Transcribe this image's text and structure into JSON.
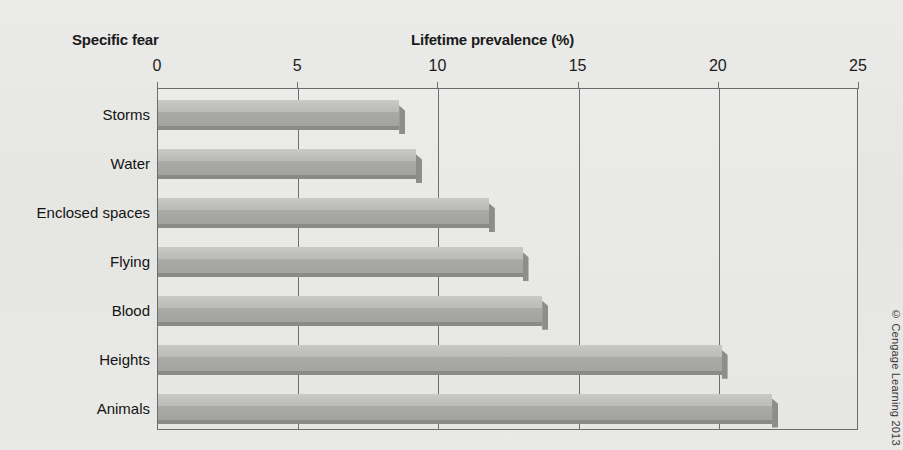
{
  "chart_data": {
    "type": "bar",
    "orientation": "horizontal",
    "title": "",
    "xlabel": "Lifetime prevalence (%)",
    "ylabel": "Specific fear",
    "categories": [
      "Storms",
      "Water",
      "Enclosed spaces",
      "Flying",
      "Blood",
      "Heights",
      "Animals"
    ],
    "values": [
      8.6,
      9.2,
      11.8,
      13.0,
      13.7,
      20.1,
      21.9
    ],
    "xlim": [
      0,
      25
    ],
    "xticks": [
      0,
      5,
      10,
      15,
      20,
      25
    ],
    "xtick_labels": [
      "0",
      "5",
      "10",
      "15",
      "20",
      "25"
    ],
    "grid": "vertical",
    "legend": "none",
    "bar_color": "#ababa8",
    "bar_top_color": "#c9c9c6",
    "bar_base_color": "#8a8a87",
    "frame_color": "#6c6c6c",
    "background_color": "#e9e9e6"
  },
  "axis_titles": {
    "category": "Specific fear",
    "value": "Lifetime prevalence (%)"
  },
  "footer": {
    "copyright": "© Cengage Learning 2013"
  }
}
